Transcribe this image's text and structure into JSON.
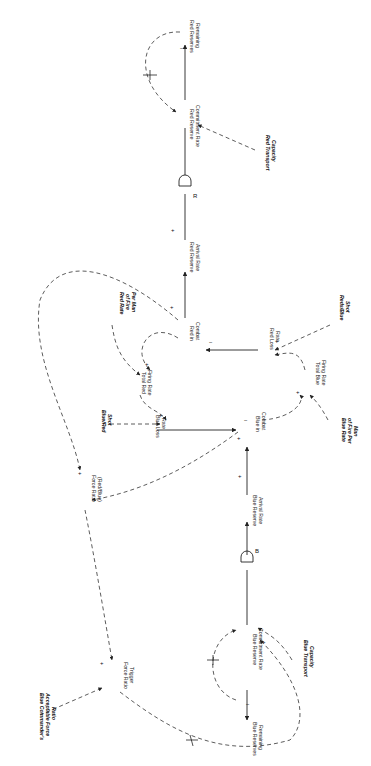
{
  "diagram": {
    "type": "causal-loop / stock-flow diagram (rotated 90 degrees)",
    "nodes": {
      "red_reserves_remaining": [
        "Red Reserves",
        "Remaining"
      ],
      "red_reserve_commitment_rate": [
        "Red Reserve",
        "Commitment Rate"
      ],
      "red_transport_capacity": [
        "Red Transport",
        "Capacity"
      ],
      "red_delay": "R",
      "red_reserve_arrival_rate": [
        "Red Reserve",
        "Arrival Rate"
      ],
      "red_in_combat": [
        "Red in",
        "Combat"
      ],
      "red_loss_rate": [
        "Red Loss",
        "Rate"
      ],
      "red_blue_shot": [
        "Reds/Blue",
        "Shot"
      ],
      "red_rate_of_fire": [
        "Red Rate",
        "of Fire",
        "Per Man"
      ],
      "total_red_firing_rate": [
        "Total Red",
        "Firing Rate"
      ],
      "blue_loss_rate": [
        "Blue Loss",
        "Rate"
      ],
      "blue_red_shot": [
        "Blue/Red",
        "Shot"
      ],
      "blue_in_combat": [
        "Blue in",
        "Combat"
      ],
      "total_blue_firing_rate": [
        "Total Blue",
        "Firing Rate"
      ],
      "blue_rate_of_fire": [
        "Blue Rate",
        "of Fire Per",
        "Man"
      ],
      "force_ratio": [
        "Force Ratio",
        "(Red/Blue)"
      ],
      "blue_reserve_arrival_rate": [
        "Blue Reserve",
        "Arrival Rate"
      ],
      "blue_delay": "B",
      "blue_reserve_commitment_rate": [
        "Blue Reserve",
        "Commitment Rate"
      ],
      "blue_transport_capacity": [
        "Blue Transport",
        "Capacity"
      ],
      "blue_reserves_remaining": [
        "Blue Reserves",
        "Remaining"
      ],
      "force_ratio_trigger": [
        "Force Ratio",
        "Trigger"
      ],
      "blue_commander_ratio": [
        "Blue Commander's",
        "Acceptable Force",
        "Ratio"
      ]
    },
    "signs": {
      "plus": "+",
      "minus": "−",
      "delay_mark": "||"
    }
  }
}
